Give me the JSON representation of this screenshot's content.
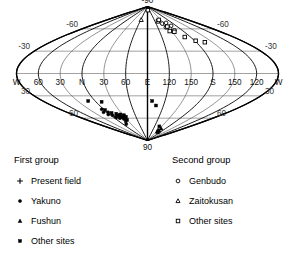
{
  "figure": {
    "projection": "sinusoidal-equal-area",
    "pole_labels": {
      "top": "-90",
      "bottom": "90"
    }
  },
  "chart_data": {
    "type": "scatter",
    "title": "",
    "subtitle": "",
    "xlabel": "",
    "ylabel": "",
    "projection": "sinusoidal equal-area global projection",
    "grid": true,
    "legend_position": "below-plot",
    "axis": {
      "longitude_ticks": [
        "W",
        "60",
        "30",
        "N",
        "30",
        "60",
        "E",
        "120",
        "150",
        "S",
        "150",
        "120",
        "W"
      ],
      "longitude_values": [
        270,
        300,
        330,
        0,
        30,
        60,
        90,
        120,
        150,
        180,
        210,
        240,
        270
      ],
      "latitude_ticks_upper": [
        "-30",
        "-60",
        "-90"
      ],
      "latitude_ticks_lower": [
        "30",
        "60",
        "90"
      ],
      "latitude_values": [
        -30,
        -60,
        -90,
        30,
        60,
        90
      ],
      "lat_range": [
        -90,
        90
      ],
      "lon_range": [
        270,
        270
      ],
      "pole_top_label": "-90",
      "pole_bottom_label": "90"
    },
    "series": [
      {
        "name": "Present field",
        "group": "First group",
        "marker": "plus",
        "fill": "none",
        "color": "#000000",
        "points": [
          {
            "lon": 10,
            "lat": 58
          }
        ]
      },
      {
        "name": "Yakuno",
        "group": "First group",
        "marker": "circle",
        "fill": "filled",
        "color": "#000000",
        "points": [
          {
            "lon": 352,
            "lat": 52
          },
          {
            "lon": 356,
            "lat": 55
          },
          {
            "lon": 2,
            "lat": 52
          },
          {
            "lon": 4,
            "lat": 56
          },
          {
            "lon": 6,
            "lat": 59
          },
          {
            "lon": 11,
            "lat": 57
          },
          {
            "lon": 14,
            "lat": 60
          },
          {
            "lon": 16,
            "lat": 57
          },
          {
            "lon": 20,
            "lat": 59
          },
          {
            "lon": 23,
            "lat": 61
          },
          {
            "lon": 26,
            "lat": 58
          },
          {
            "lon": 30,
            "lat": 57
          },
          {
            "lon": 12,
            "lat": 68
          },
          {
            "lon": 356,
            "lat": 48
          }
        ]
      },
      {
        "name": "Fushun",
        "group": "First group",
        "marker": "triangle",
        "fill": "filled",
        "color": "#000000",
        "points": [
          {
            "lon": 150,
            "lat": 76
          },
          {
            "lon": 154,
            "lat": 78
          },
          {
            "lon": 158,
            "lat": 74
          },
          {
            "lon": 161,
            "lat": 77
          },
          {
            "lon": 164,
            "lat": 79
          }
        ]
      },
      {
        "name": "Other sites",
        "group": "First group",
        "marker": "square",
        "fill": "filled",
        "color": "#000000",
        "points": [
          {
            "lon": 348,
            "lat": 37
          },
          {
            "lon": 10,
            "lat": 38
          },
          {
            "lon": 1,
            "lat": 49
          },
          {
            "lon": 8,
            "lat": 53
          },
          {
            "lon": 17,
            "lat": 54
          },
          {
            "lon": 21,
            "lat": 56
          },
          {
            "lon": 25,
            "lat": 55
          },
          {
            "lon": 28,
            "lat": 59
          },
          {
            "lon": 32,
            "lat": 56
          },
          {
            "lon": 34,
            "lat": 58
          },
          {
            "lon": 22,
            "lat": 64
          },
          {
            "lon": 98,
            "lat": 37
          },
          {
            "lon": 106,
            "lat": 43
          },
          {
            "lon": 140,
            "lat": 71
          },
          {
            "lon": 30,
            "lat": 62
          }
        ]
      },
      {
        "name": "Genbudo",
        "group": "Second group",
        "marker": "circle",
        "fill": "open",
        "color": "#000000",
        "points": [
          {
            "lon": 142,
            "lat": -67
          },
          {
            "lon": 150,
            "lat": -66
          },
          {
            "lon": 158,
            "lat": -68
          },
          {
            "lon": 164,
            "lat": -64
          },
          {
            "lon": 152,
            "lat": -60
          },
          {
            "lon": 144,
            "lat": -62
          },
          {
            "lon": 160,
            "lat": -58
          }
        ]
      },
      {
        "name": "Zaitokusan",
        "group": "Second group",
        "marker": "triangle",
        "fill": "open",
        "color": "#000000",
        "points": [
          {
            "lon": 62,
            "lat": -72
          }
        ]
      },
      {
        "name": "Other sites",
        "group": "Second group",
        "marker": "square",
        "fill": "open",
        "color": "#000000",
        "points": [
          {
            "lon": 96,
            "lat": -85
          },
          {
            "lon": 132,
            "lat": -70
          },
          {
            "lon": 140,
            "lat": -72
          },
          {
            "lon": 150,
            "lat": -63
          },
          {
            "lon": 146,
            "lat": -57
          },
          {
            "lon": 168,
            "lat": -49
          },
          {
            "lon": 182,
            "lat": -44
          },
          {
            "lon": 196,
            "lat": -42
          },
          {
            "lon": 156,
            "lat": -56
          }
        ]
      }
    ]
  },
  "legend": {
    "left": {
      "title": "First group",
      "items": [
        {
          "label": "Present field",
          "marker": "plus"
        },
        {
          "label": "Yakuno",
          "marker": "circle-filled"
        },
        {
          "label": "Fushun",
          "marker": "triangle-filled"
        },
        {
          "label": "Other sites",
          "marker": "square-filled"
        }
      ]
    },
    "right": {
      "title": "Second group",
      "items": [
        {
          "label": "Genbudo",
          "marker": "circle-open"
        },
        {
          "label": "Zaitokusan",
          "marker": "triangle-open"
        },
        {
          "label": "Other sites",
          "marker": "square-open"
        }
      ]
    }
  },
  "colors": {
    "ink": "#000000",
    "grid_lat": "#8a8a8a",
    "grid_lon": "#000000",
    "background": "#ffffff"
  }
}
